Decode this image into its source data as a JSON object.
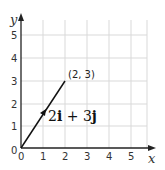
{
  "diagram": {
    "type": "vector_on_grid",
    "axes": {
      "x_label": "x",
      "y_label": "y",
      "x_ticks": [
        "0",
        "1",
        "2",
        "3",
        "4",
        "5"
      ],
      "y_ticks": [
        "0",
        "1",
        "2",
        "3",
        "4",
        "5"
      ]
    },
    "vector": {
      "from": [
        0,
        0
      ],
      "to": [
        2,
        3
      ],
      "endpoint_label": "(2, 3)",
      "label_coef_i": "2",
      "label_i": "i",
      "label_plus": " + ",
      "label_coef_j": "3",
      "label_j": "j"
    },
    "colors": {
      "grid": "#d9d9d9",
      "axis": "#222222",
      "vector": "#111111"
    }
  }
}
